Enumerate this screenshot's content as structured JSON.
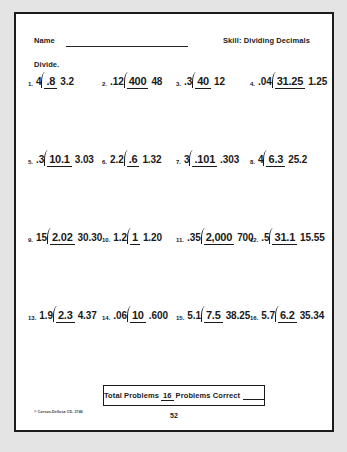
{
  "worksheet": {
    "name_label": "Name",
    "skill_label": "Skill:  Dividing Decimals",
    "directions": "Divide.",
    "problems": [
      {
        "number": "1.",
        "quotient": ".8",
        "divisor": "4",
        "dividend": "3.2"
      },
      {
        "number": "2.",
        "quotient": "400",
        "divisor": ".12",
        "dividend": "48"
      },
      {
        "number": "3.",
        "quotient": "40",
        "divisor": ".3",
        "dividend": "12"
      },
      {
        "number": "4.",
        "quotient": "31.25",
        "divisor": ".04",
        "dividend": "1.25"
      },
      {
        "number": "5.",
        "quotient": "10.1",
        "divisor": ".3",
        "dividend": "3.03"
      },
      {
        "number": "6.",
        "quotient": ".6",
        "divisor": "2.2",
        "dividend": "1.32"
      },
      {
        "number": "7.",
        "quotient": ".101",
        "divisor": "3",
        "dividend": ".303"
      },
      {
        "number": "8.",
        "quotient": "6.3",
        "divisor": "4",
        "dividend": "25.2"
      },
      {
        "number": "9.",
        "quotient": "2.02",
        "divisor": "15",
        "dividend": "30.30"
      },
      {
        "number": "10.",
        "quotient": "1",
        "divisor": "1.2",
        "dividend": "1.20"
      },
      {
        "number": "11.",
        "quotient": "2,000",
        "divisor": ".35",
        "dividend": "700"
      },
      {
        "number": "12.",
        "quotient": "31.1",
        "divisor": ".5",
        "dividend": "15.55"
      },
      {
        "number": "13.",
        "quotient": "2.3",
        "divisor": "1.9",
        "dividend": "4.37"
      },
      {
        "number": "14.",
        "quotient": "10",
        "divisor": ".06",
        "dividend": ".600"
      },
      {
        "number": "15.",
        "quotient": "7.5",
        "divisor": "5.1",
        "dividend": "38.25"
      },
      {
        "number": "16.",
        "quotient": "6.2",
        "divisor": "5.7",
        "dividend": "35.34"
      }
    ],
    "footer": {
      "total_problems_label": "Total Problems",
      "total_problems_value": "16",
      "problems_correct_label": "Problems Correct",
      "problems_correct_value": "",
      "copyright": "© Carson-Dellosa CD- 3746",
      "page_number": "52"
    }
  }
}
